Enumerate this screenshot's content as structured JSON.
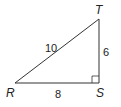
{
  "diagram": {
    "type": "right-triangle",
    "vertices": [
      {
        "name": "R",
        "label": "R"
      },
      {
        "name": "S",
        "label": "S"
      },
      {
        "name": "T",
        "label": "T"
      }
    ],
    "sides": {
      "RT": "10",
      "ST": "6",
      "RS": "8"
    },
    "right_angle_at": "S",
    "stroke_color": "#333333"
  }
}
